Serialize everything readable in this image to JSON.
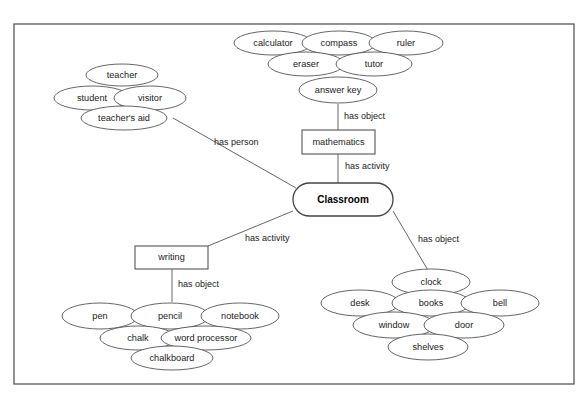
{
  "diagram": {
    "type": "concept-map",
    "frame": {
      "x": 14,
      "y": 24,
      "width": 560,
      "height": 360
    },
    "root": {
      "id": "classroom",
      "label": "Classroom",
      "shape": "rounded-rect",
      "x": 293,
      "y": 183,
      "width": 100,
      "height": 33
    },
    "intermediate_nodes": [
      {
        "id": "mathematics",
        "label": "mathematics",
        "shape": "rect",
        "x": 302,
        "y": 130,
        "width": 73,
        "height": 24
      },
      {
        "id": "writing",
        "label": "writing",
        "shape": "rect",
        "x": 135,
        "y": 246,
        "width": 73,
        "height": 23
      }
    ],
    "edges": [
      {
        "id": "edge-has-person",
        "label": "has person",
        "from": "teachers-aid",
        "to": "classroom",
        "x1": 173,
        "y1": 118,
        "x2": 296,
        "y2": 188,
        "label_x": 214,
        "label_y": 143
      },
      {
        "id": "edge-has-object-math",
        "label": "has object",
        "from": "answer-key",
        "to": "mathematics",
        "x1": 338,
        "y1": 104,
        "x2": 338,
        "y2": 130,
        "label_x": 344,
        "label_y": 117
      },
      {
        "id": "edge-has-activity-math",
        "label": "has activity",
        "from": "mathematics",
        "to": "classroom",
        "x1": 338,
        "y1": 154,
        "x2": 338,
        "y2": 183,
        "label_x": 345,
        "label_y": 167
      },
      {
        "id": "edge-has-activity-writing",
        "label": "has activity",
        "from": "classroom",
        "to": "writing",
        "x1": 293,
        "y1": 211,
        "x2": 208,
        "y2": 246,
        "label_x": 245,
        "label_y": 239
      },
      {
        "id": "edge-has-object-writing",
        "label": "has object",
        "from": "writing",
        "to": "pencil",
        "x1": 172,
        "y1": 269,
        "x2": 172,
        "y2": 302,
        "label_x": 178,
        "label_y": 285
      },
      {
        "id": "edge-has-object-room",
        "label": "has object",
        "from": "classroom",
        "to": "clock",
        "x1": 393,
        "y1": 211,
        "x2": 429,
        "y2": 272,
        "label_x": 418,
        "label_y": 240
      }
    ],
    "clusters": [
      {
        "id": "person-cluster",
        "relation": "has person",
        "nodes": [
          {
            "id": "teacher",
            "label": "teacher",
            "cx": 122,
            "cy": 75,
            "rx": 36,
            "ry": 11
          },
          {
            "id": "student",
            "label": "student",
            "cx": 92,
            "cy": 98,
            "rx": 38,
            "ry": 12
          },
          {
            "id": "visitor",
            "label": "visitor",
            "cx": 150,
            "cy": 98,
            "rx": 36,
            "ry": 12
          },
          {
            "id": "teachers-aid",
            "label": "teacher's aid",
            "cx": 124,
            "cy": 118,
            "rx": 43,
            "ry": 12
          }
        ]
      },
      {
        "id": "math-object-cluster",
        "relation": "has object",
        "nodes": [
          {
            "id": "calculator",
            "label": "calculator",
            "cx": 273,
            "cy": 43,
            "rx": 39,
            "ry": 12
          },
          {
            "id": "compass",
            "label": "compass",
            "cx": 339,
            "cy": 43,
            "rx": 37,
            "ry": 12
          },
          {
            "id": "ruler",
            "label": "ruler",
            "cx": 406,
            "cy": 43,
            "rx": 37,
            "ry": 12
          },
          {
            "id": "eraser",
            "label": "eraser",
            "cx": 306,
            "cy": 64,
            "rx": 38,
            "ry": 12
          },
          {
            "id": "tutor",
            "label": "tutor",
            "cx": 374,
            "cy": 64,
            "rx": 38,
            "ry": 12
          },
          {
            "id": "answer-key",
            "label": "answer key",
            "cx": 338,
            "cy": 90,
            "rx": 39,
            "ry": 13
          }
        ]
      },
      {
        "id": "writing-object-cluster",
        "relation": "has object",
        "nodes": [
          {
            "id": "pen",
            "label": "pen",
            "cx": 100,
            "cy": 316,
            "rx": 38,
            "ry": 13
          },
          {
            "id": "pencil",
            "label": "pencil",
            "cx": 170,
            "cy": 316,
            "rx": 39,
            "ry": 13
          },
          {
            "id": "notebook",
            "label": "notebook",
            "cx": 240,
            "cy": 316,
            "rx": 39,
            "ry": 13
          },
          {
            "id": "chalk",
            "label": "chalk",
            "cx": 138,
            "cy": 338,
            "rx": 38,
            "ry": 12
          },
          {
            "id": "word-processor",
            "label": "word processor",
            "cx": 206,
            "cy": 338,
            "rx": 45,
            "ry": 12
          },
          {
            "id": "chalkboard",
            "label": "chalkboard",
            "cx": 172,
            "cy": 358,
            "rx": 41,
            "ry": 12
          }
        ]
      },
      {
        "id": "room-object-cluster",
        "relation": "has object",
        "nodes": [
          {
            "id": "clock",
            "label": "clock",
            "cx": 431,
            "cy": 282,
            "rx": 39,
            "ry": 13
          },
          {
            "id": "desk",
            "label": "desk",
            "cx": 360,
            "cy": 303,
            "rx": 39,
            "ry": 13
          },
          {
            "id": "books",
            "label": "books",
            "cx": 431,
            "cy": 303,
            "rx": 39,
            "ry": 13
          },
          {
            "id": "bell",
            "label": "bell",
            "cx": 500,
            "cy": 303,
            "rx": 39,
            "ry": 13
          },
          {
            "id": "window",
            "label": "window",
            "cx": 394,
            "cy": 325,
            "rx": 41,
            "ry": 13
          },
          {
            "id": "door",
            "label": "door",
            "cx": 464,
            "cy": 325,
            "rx": 40,
            "ry": 13
          },
          {
            "id": "shelves",
            "label": "shelves",
            "cx": 428,
            "cy": 347,
            "rx": 40,
            "ry": 13
          }
        ]
      }
    ],
    "colors": {
      "frame_stroke": "#4a4a4a",
      "node_stroke": "#555555",
      "edge_stroke": "#555555",
      "text": "#1a1a1a",
      "background": "#ffffff"
    }
  }
}
